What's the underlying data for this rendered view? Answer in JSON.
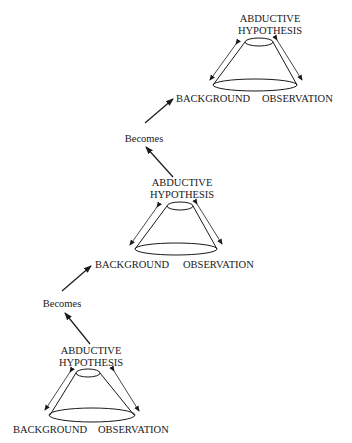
{
  "diagram": {
    "type": "flow",
    "stages": [
      {
        "position": "bottom",
        "top_label_line1": "ABDUCTIVE",
        "top_label_line2": "HYPOTHESIS",
        "left_label": "BACKGROUND",
        "right_label": "OBSERVATION"
      },
      {
        "position": "middle",
        "top_label_line1": "ABDUCTIVE",
        "top_label_line2": "HYPOTHESIS",
        "left_label": "BACKGROUND",
        "right_label": "OBSERVATION"
      },
      {
        "position": "top",
        "top_label_line1": "ABDUCTIVE",
        "top_label_line2": "HYPOTHESIS",
        "left_label": "BACKGROUND",
        "right_label": "OBSERVATION"
      }
    ],
    "transitions": [
      {
        "label": "Becomes",
        "from": "bottom.hypothesis",
        "to": "middle.background"
      },
      {
        "label": "Becomes",
        "from": "middle.hypothesis",
        "to": "top.background"
      }
    ]
  }
}
